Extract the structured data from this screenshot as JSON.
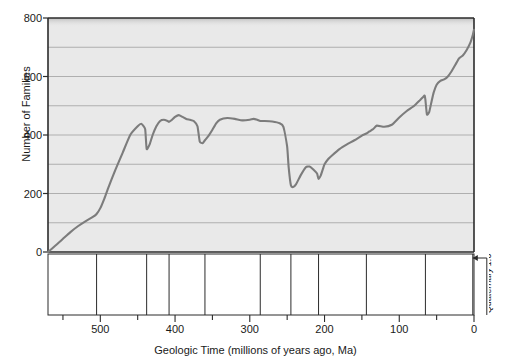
{
  "chart_data": {
    "type": "line",
    "title": "",
    "xlabel": "Geologic Time (millions of years ago, Ma)",
    "ylabel": "Number of Families",
    "xlim": [
      570,
      0
    ],
    "ylim": [
      0,
      800
    ],
    "x_reversed": true,
    "grid": "horizontal",
    "legend": "none",
    "yticks": [
      0,
      200,
      400,
      600,
      800
    ],
    "ytick_labels": [
      "0",
      "200",
      "400",
      "600",
      "800"
    ],
    "y_gridlines": [
      0,
      100,
      200,
      300,
      400,
      500,
      600,
      700,
      800
    ],
    "xticks": [
      500,
      400,
      300,
      200,
      100,
      0
    ],
    "xtick_labels": [
      "500",
      "400",
      "300",
      "200",
      "100",
      "0"
    ],
    "x_minor_ticks": [
      550,
      500,
      450,
      400,
      350,
      300,
      250,
      200,
      150,
      100,
      50,
      0
    ],
    "series_name": "Number of marine and continental families",
    "x": [
      570,
      560,
      550,
      540,
      530,
      520,
      510,
      505,
      500,
      495,
      490,
      480,
      470,
      460,
      450,
      445,
      440,
      438,
      434,
      430,
      425,
      420,
      415,
      410,
      408,
      404,
      400,
      395,
      390,
      385,
      380,
      375,
      370,
      367,
      363,
      360,
      355,
      350,
      345,
      340,
      330,
      320,
      310,
      300,
      295,
      290,
      286,
      280,
      270,
      260,
      255,
      250,
      248,
      245,
      242,
      238,
      232,
      225,
      220,
      215,
      210,
      208,
      205,
      202,
      200,
      195,
      190,
      180,
      170,
      160,
      150,
      144,
      140,
      135,
      130,
      120,
      110,
      100,
      90,
      80,
      72,
      68,
      66,
      65,
      63,
      60,
      57,
      54,
      50,
      45,
      40,
      35,
      30,
      25,
      20,
      15,
      10,
      5,
      1.6,
      0
    ],
    "y": [
      0,
      22,
      45,
      68,
      88,
      105,
      120,
      130,
      150,
      180,
      215,
      280,
      340,
      400,
      430,
      438,
      420,
      352,
      368,
      400,
      430,
      448,
      452,
      448,
      445,
      452,
      462,
      468,
      462,
      455,
      452,
      448,
      430,
      378,
      372,
      382,
      398,
      418,
      440,
      452,
      458,
      455,
      450,
      452,
      455,
      452,
      448,
      448,
      446,
      440,
      428,
      360,
      290,
      228,
      222,
      232,
      262,
      290,
      292,
      282,
      268,
      250,
      262,
      285,
      300,
      318,
      330,
      352,
      368,
      382,
      398,
      405,
      412,
      420,
      432,
      428,
      435,
      460,
      482,
      500,
      520,
      530,
      535,
      520,
      470,
      478,
      512,
      545,
      572,
      585,
      590,
      600,
      618,
      640,
      662,
      672,
      690,
      715,
      742,
      760
    ]
  },
  "periods": [
    {
      "name": "Cambrian",
      "range": "570 to 505 Ma",
      "start": 570,
      "end": 505
    },
    {
      "name": "Ordovician",
      "range": "505 to 438 Ma",
      "start": 505,
      "end": 438
    },
    {
      "name": "Silurian",
      "range": "438 to 408 Ma",
      "start": 438,
      "end": 408
    },
    {
      "name": "Devonian",
      "range": "408 to 360 Ma",
      "start": 408,
      "end": 360
    },
    {
      "name": "Carboniferous",
      "range": "360 to 286 Ma",
      "start": 360,
      "end": 286
    },
    {
      "name": "Permian",
      "range": "286 to 245 Ma",
      "start": 286,
      "end": 245
    },
    {
      "name": "Triassic",
      "range": "245 to 208 Ma",
      "start": 245,
      "end": 208
    },
    {
      "name": "Jurassic",
      "range": "208 to 144 Ma",
      "start": 208,
      "end": 144
    },
    {
      "name": "Cretaceous",
      "range": "144 to 65 Ma",
      "start": 144,
      "end": 65
    },
    {
      "name": "Tertiary",
      "range": "65 to 1.6 Ma",
      "start": 65,
      "end": 1.6
    },
    {
      "name": "Quaternary",
      "range": "1.6 to 0 Ma",
      "start": 1.6,
      "end": 0
    }
  ],
  "colors": {
    "plot_background": "#e9e9e9",
    "curve": "#7c7c7c",
    "gridline": "#a8a8a8",
    "axis": "#2b2b2b",
    "text": "#1a1a1a",
    "page_background": "#ffffff"
  }
}
